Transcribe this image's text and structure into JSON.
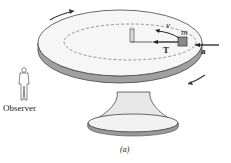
{
  "figure": {
    "caption": "(a)",
    "observer_label": "Observer",
    "mass_label": "m",
    "velocity_label": "v",
    "tension_label": "T",
    "acceleration_label": "a",
    "icons": {
      "observer": "person-figure-icon",
      "rotation_arrows": "curved-arrow-icon"
    },
    "colors": {
      "ink": "#333333",
      "table_top": "#f4f4f4",
      "table_edge": "#9a9a9a",
      "block": "#8a8a8a"
    }
  }
}
